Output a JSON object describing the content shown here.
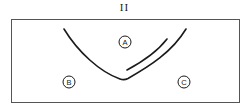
{
  "figure": {
    "title": "II",
    "colors": {
      "stroke": "#1a1a1a",
      "box_stroke": "#555555",
      "background": "#ffffff"
    },
    "regions": [
      {
        "id": "A",
        "label": "A",
        "cx": 125,
        "cy": 42
      },
      {
        "id": "B",
        "label": "B",
        "cx": 69,
        "cy": 82
      },
      {
        "id": "C",
        "label": "C",
        "cx": 184,
        "cy": 82
      }
    ],
    "curves": [
      {
        "name": "outer-curve",
        "description": "V-shaped curve opening upward"
      },
      {
        "name": "inner-curve",
        "description": "shorter parallel curve on right arm"
      }
    ]
  }
}
